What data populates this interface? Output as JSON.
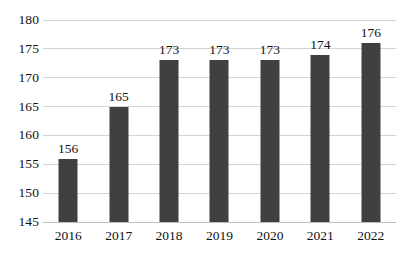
{
  "chart_data": {
    "type": "bar",
    "title": "",
    "subtitle": "",
    "xlabel": "",
    "ylabel": "",
    "categories": [
      "2016",
      "2017",
      "2018",
      "2019",
      "2020",
      "2021",
      "2022"
    ],
    "values": [
      156,
      165,
      173,
      173,
      173,
      174,
      176
    ],
    "data_labels": [
      "156",
      "165",
      "173",
      "173",
      "173",
      "174",
      "176"
    ],
    "ylim": [
      145,
      180
    ],
    "ytick_step": 5,
    "ytick_labels": [
      "180",
      "175",
      "170",
      "165",
      "160",
      "155",
      "150",
      "145"
    ],
    "ytick_values": [
      180,
      175,
      170,
      165,
      160,
      155,
      150,
      145
    ],
    "grid": true,
    "grid_axis": "y",
    "legend": false,
    "legend_position": "none",
    "bar_color": "#404040",
    "grid_color": "#d4d4d4",
    "axis_color": "#bfbfbf",
    "text_color": "#111111",
    "background_color": "#ffffff"
  }
}
